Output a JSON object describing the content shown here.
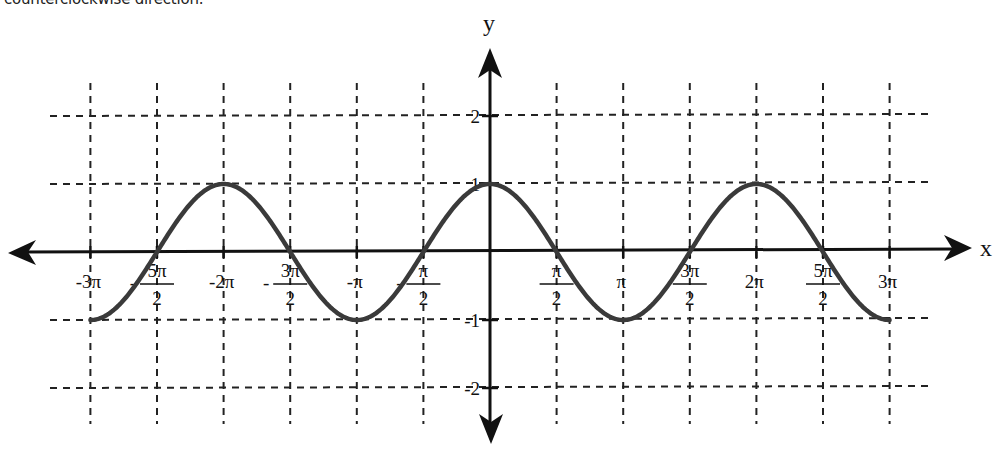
{
  "caption": "counterclockwise direction.",
  "chart_data": {
    "type": "line",
    "title": "",
    "function": "y = cos(x)",
    "xlabel": "x",
    "ylabel": "y",
    "xlim": [
      -9.42477796,
      9.42477796
    ],
    "ylim": [
      -2,
      2
    ],
    "grid": true,
    "grid_style": "dashed",
    "x_ticks": [
      {
        "value": -9.42477796,
        "label": "-3π"
      },
      {
        "value": -7.85398163,
        "label": "-5π/2"
      },
      {
        "value": -6.28318531,
        "label": "-2π"
      },
      {
        "value": -4.71238898,
        "label": "-3π/2"
      },
      {
        "value": -3.14159265,
        "label": "-π"
      },
      {
        "value": -1.57079633,
        "label": "-π/2"
      },
      {
        "value": 1.57079633,
        "label": "π/2"
      },
      {
        "value": 3.14159265,
        "label": "π"
      },
      {
        "value": 4.71238898,
        "label": "3π/2"
      },
      {
        "value": 6.28318531,
        "label": "2π"
      },
      {
        "value": 7.85398163,
        "label": "5π/2"
      },
      {
        "value": 9.42477796,
        "label": "3π"
      }
    ],
    "y_ticks": [
      {
        "value": 2,
        "label": "2"
      },
      {
        "value": 1,
        "label": "1"
      },
      {
        "value": -1,
        "label": "-1"
      },
      {
        "value": -2,
        "label": "-2"
      }
    ],
    "series": [
      {
        "name": "cos(x)",
        "color": "#3a3a3a",
        "x": [
          -9.42477796,
          -7.85398163,
          -6.28318531,
          -4.71238898,
          -3.14159265,
          -1.57079633,
          0,
          1.57079633,
          3.14159265,
          4.71238898,
          6.28318531,
          7.85398163,
          9.42477796
        ],
        "values": [
          -1,
          0,
          1,
          0,
          -1,
          0,
          1,
          0,
          -1,
          0,
          1,
          0,
          -1
        ]
      }
    ]
  },
  "labels": {
    "x_axis": "x",
    "y_axis": "y",
    "xt": [
      {
        "num": "-3π",
        "den": ""
      },
      {
        "sign": "-",
        "num": "5π",
        "den": "2"
      },
      {
        "num": "-2π",
        "den": ""
      },
      {
        "sign": "-",
        "num": "3π",
        "den": "2"
      },
      {
        "num": "-π",
        "den": ""
      },
      {
        "sign": "-",
        "num": "π",
        "den": "2"
      },
      {
        "num": "π",
        "den": "2"
      },
      {
        "num": "π",
        "den": ""
      },
      {
        "num": "3π",
        "den": "2"
      },
      {
        "num": "2π",
        "den": ""
      },
      {
        "num": "5π",
        "den": "2"
      },
      {
        "num": "3π",
        "den": ""
      }
    ],
    "yt": [
      "2",
      "1",
      "-1",
      "-2"
    ]
  }
}
